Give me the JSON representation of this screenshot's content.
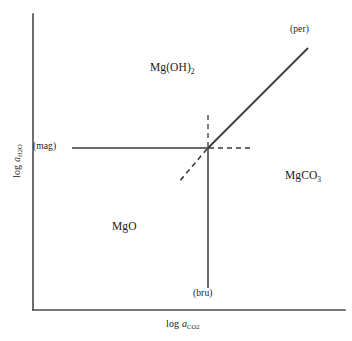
{
  "figure": {
    "kind": "activity-activity phase diagram",
    "background_color": "#ffffff",
    "line_color": "#3a3a3a"
  },
  "axes": {
    "x": {
      "title_prefix": "log ",
      "title_symbol": "a",
      "title_subscript": "CO",
      "title_subscript_tail": "2",
      "title_plain": "log a_CO2",
      "line": {
        "x1": 33,
        "y1": 310,
        "x2": 345,
        "y2": 310
      }
    },
    "y": {
      "title_prefix": "log ",
      "title_symbol": "a",
      "title_subscript": "H",
      "title_subscript_mid": "2",
      "title_subscript_tail": "O",
      "title_plain": "log a_H2O",
      "line": {
        "x1": 33,
        "y1": 14,
        "x2": 33,
        "y2": 310
      }
    }
  },
  "phase_fields": [
    {
      "id": "brucite",
      "label": "Mg(OH)",
      "subscript": "2",
      "x": 150,
      "y": 62
    },
    {
      "id": "periclase",
      "label": "MgO",
      "subscript": "",
      "x": 112,
      "y": 221
    },
    {
      "id": "magnesite",
      "label": "MgCO",
      "subscript": "3",
      "x": 285,
      "y": 170
    }
  ],
  "reaction_labels": [
    {
      "id": "per",
      "label": "(per)",
      "x": 290,
      "y": 25
    },
    {
      "id": "mag",
      "label": "(mag)",
      "x": 33,
      "y": 142
    },
    {
      "id": "bru",
      "label": "(bru)",
      "x": 193,
      "y": 289
    }
  ],
  "invariant_point": {
    "x": 208,
    "y": 148
  },
  "reaction_lines": {
    "stable": [
      {
        "id": "mag-line",
        "x1": 72,
        "y1": 148,
        "x2": 208,
        "y2": 148
      },
      {
        "id": "bru-line",
        "x1": 208,
        "y1": 148,
        "x2": 208,
        "y2": 288
      },
      {
        "id": "per-line",
        "x1": 208,
        "y1": 148,
        "x2": 308,
        "y2": 48
      }
    ],
    "metastable": [
      {
        "id": "bru-ext",
        "x1": 208,
        "y1": 148,
        "x2": 208,
        "y2": 112
      },
      {
        "id": "mag-ext",
        "x1": 208,
        "y1": 148,
        "x2": 250,
        "y2": 148
      },
      {
        "id": "per-ext",
        "x1": 208,
        "y1": 148,
        "x2": 178,
        "y2": 183
      }
    ]
  }
}
